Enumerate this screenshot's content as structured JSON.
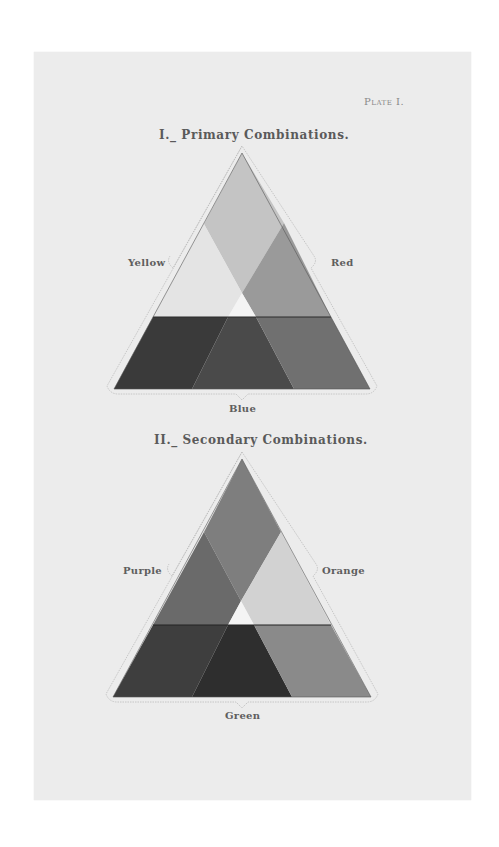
{
  "plate_label": "Plate I.",
  "figures": [
    {
      "title": "I._ Primary Combinations.",
      "labels": {
        "left": "Yellow",
        "right": "Red",
        "bottom": "Blue"
      },
      "colors": {
        "top": "#c4c4c4",
        "left": "#e4e4e4",
        "right": "#9a9a9a",
        "center": "#f2f2f2",
        "bottom_left": "#3a3a3a",
        "bottom_mid": "#4a4a4a",
        "bottom_right": "#707070"
      }
    },
    {
      "title": "II._ Secondary Combinations.",
      "labels": {
        "left": "Purple",
        "right": "Orange",
        "bottom": "Green"
      },
      "colors": {
        "top": "#7e7e7e",
        "left": "#6a6a6a",
        "right": "#d2d2d2",
        "center": "#f4f4f4",
        "bottom_left": "#3e3e3e",
        "bottom_mid": "#2e2e2e",
        "bottom_right": "#8a8a8a"
      }
    }
  ]
}
